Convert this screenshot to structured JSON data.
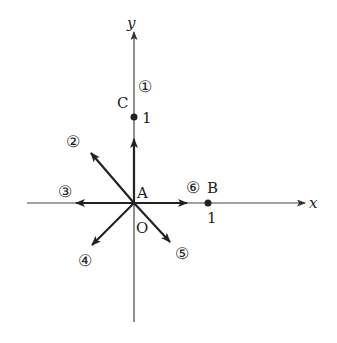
{
  "figure": {
    "axes": {
      "x_label": "x",
      "y_label": "y",
      "origin_label": "O"
    },
    "points": {
      "A": {
        "label": "A",
        "coord": "(0,0)"
      },
      "B": {
        "label": "B",
        "tick": "1",
        "coord": "(1,0)"
      },
      "C": {
        "label": "C",
        "tick": "1",
        "coord": "(0,1)"
      }
    },
    "vectors": [
      {
        "id": "1",
        "label": "①",
        "direction": "up"
      },
      {
        "id": "2",
        "label": "②",
        "direction": "up-left"
      },
      {
        "id": "3",
        "label": "③",
        "direction": "left"
      },
      {
        "id": "4",
        "label": "④",
        "direction": "down-left"
      },
      {
        "id": "5",
        "label": "⑤",
        "direction": "down-right"
      },
      {
        "id": "6",
        "label": "⑥",
        "direction": "right"
      }
    ],
    "colors": {
      "ink": "#222222",
      "axis": "#555555"
    }
  }
}
